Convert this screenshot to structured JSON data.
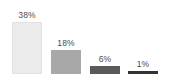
{
  "chart_data": {
    "type": "bar",
    "title": "",
    "subtitle": "",
    "xlabel": "",
    "ylabel": "",
    "categories": [
      "",
      "",
      "",
      ""
    ],
    "values": [
      38,
      18,
      6,
      1
    ],
    "value_labels": [
      "38%",
      "18%",
      "6%",
      "1%"
    ],
    "unit": "%",
    "ylim": [
      0,
      42
    ],
    "grid": false,
    "axis_visible": false,
    "legend": false,
    "legend_position": "none",
    "orientation": "vertical",
    "bar_colors": [
      "#ebebeb",
      "#a8a8a8",
      "#5a5a5a",
      "#333333"
    ],
    "label_color": "#4a4a4a",
    "background": "#ffffff",
    "bars": [
      {
        "label": "38%",
        "value": 38,
        "color": "#ebebeb",
        "border": "#e2e2e2"
      },
      {
        "label": "18%",
        "value": 18,
        "color": "#a8a8a8",
        "border": "#a8a8a8"
      },
      {
        "label": "6%",
        "value": 6,
        "color": "#5a5a5a",
        "border": "#5a5a5a"
      },
      {
        "label": "1%",
        "value": 1,
        "color": "#333333",
        "border": "#333333"
      }
    ]
  }
}
